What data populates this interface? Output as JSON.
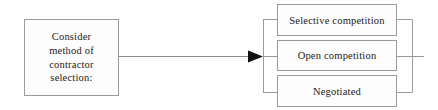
{
  "diagram": {
    "type": "flowchart",
    "background_color": "#fefefe",
    "line_color": "#9a9a9a",
    "text_color": "#1d1a18",
    "source": {
      "label": "Consider\nmethod of\ncontractor\nselection:",
      "lines": [
        "Consider",
        "method of",
        "contractor",
        "selection:"
      ]
    },
    "connector": {
      "arrow_name": "arrowhead",
      "direction": "right"
    },
    "options": [
      {
        "label": "Selective competition"
      },
      {
        "label": "Open competition"
      },
      {
        "label": "Negotiated"
      }
    ]
  }
}
